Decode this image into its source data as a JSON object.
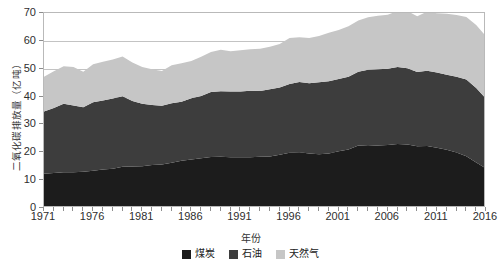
{
  "chart_data": {
    "type": "area",
    "title": "",
    "xlabel": "年份",
    "ylabel": "二氧化碳排放量（亿吨）",
    "stacked": true,
    "grid": true,
    "legend_position": "bottom",
    "xlim": [
      1971,
      2016
    ],
    "ylim": [
      0,
      70
    ],
    "yticks": [
      0,
      10,
      20,
      30,
      40,
      50,
      60,
      70
    ],
    "xticks": [
      1971,
      1976,
      1981,
      1986,
      1991,
      1996,
      2001,
      2006,
      2011,
      2016
    ],
    "x": [
      1971,
      1972,
      1973,
      1974,
      1975,
      1976,
      1977,
      1978,
      1979,
      1980,
      1981,
      1982,
      1983,
      1984,
      1985,
      1986,
      1987,
      1988,
      1989,
      1990,
      1991,
      1992,
      1993,
      1994,
      1995,
      1996,
      1997,
      1998,
      1999,
      2000,
      2001,
      2002,
      2003,
      2004,
      2005,
      2006,
      2007,
      2008,
      2009,
      2010,
      2011,
      2012,
      2013,
      2014,
      2015,
      2016
    ],
    "series": [
      {
        "name": "煤炭",
        "color": "#1c1c1c",
        "values": [
          12.3,
          12.6,
          12.8,
          12.8,
          13.0,
          13.4,
          13.8,
          14.1,
          14.8,
          14.9,
          15.0,
          15.4,
          15.6,
          16.2,
          17.0,
          17.4,
          17.9,
          18.3,
          18.4,
          18.2,
          18.2,
          18.2,
          18.4,
          18.5,
          19.1,
          19.8,
          20.0,
          19.6,
          19.3,
          19.6,
          20.4,
          21.0,
          22.4,
          22.3,
          22.4,
          22.6,
          23.0,
          22.8,
          22.2,
          22.3,
          21.6,
          20.9,
          19.9,
          18.6,
          16.3,
          14.2
        ]
      },
      {
        "name": "石油",
        "color": "#3d3d3d",
        "values": [
          22.3,
          23.3,
          24.6,
          24.0,
          23.2,
          24.6,
          24.8,
          25.2,
          25.3,
          23.5,
          22.4,
          21.6,
          21.1,
          21.4,
          21.1,
          22.0,
          22.3,
          23.3,
          23.5,
          23.6,
          23.6,
          23.9,
          23.6,
          24.1,
          24.2,
          24.7,
          25.2,
          25.2,
          25.8,
          25.9,
          25.9,
          26.1,
          26.5,
          27.3,
          27.4,
          27.4,
          27.6,
          27.4,
          26.6,
          27.0,
          27.0,
          26.9,
          27.2,
          27.5,
          26.8,
          25.0
        ]
      },
      {
        "name": "天然气",
        "color": "#c6c6c6",
        "values": [
          12.5,
          13.2,
          13.5,
          13.8,
          12.7,
          13.6,
          13.9,
          14.0,
          14.3,
          13.8,
          13.2,
          12.8,
          12.5,
          13.6,
          13.9,
          13.4,
          14.1,
          14.4,
          14.9,
          14.5,
          14.8,
          14.9,
          15.2,
          15.3,
          15.6,
          16.5,
          16.1,
          16.2,
          16.6,
          17.4,
          17.6,
          18.1,
          18.4,
          18.9,
          19.2,
          19.4,
          20.1,
          20.5,
          20.0,
          21.2,
          21.3,
          21.9,
          22.2,
          22.5,
          22.6,
          22.4
        ]
      }
    ]
  },
  "axis": {
    "y_title": "二氧化碳排放量（亿吨）",
    "x_title": "年份",
    "y_tick_labels": [
      "70",
      "60",
      "50",
      "40",
      "30",
      "20",
      "10",
      "0"
    ],
    "x_tick_labels": [
      "1971",
      "1976",
      "1981",
      "1986",
      "1991",
      "1996",
      "2001",
      "2006",
      "2011",
      "2016"
    ]
  },
  "legend": {
    "items": [
      {
        "label": "煤炭",
        "color": "#1c1c1c"
      },
      {
        "label": "石油",
        "color": "#3d3d3d"
      },
      {
        "label": "天然气",
        "color": "#c6c6c6"
      }
    ]
  },
  "colors": {
    "coal": "#1c1c1c",
    "oil": "#3d3d3d",
    "gas": "#c6c6c6",
    "grid": "#c3c3c3",
    "frame": "#b9b9b9",
    "background": "#ffffff"
  }
}
